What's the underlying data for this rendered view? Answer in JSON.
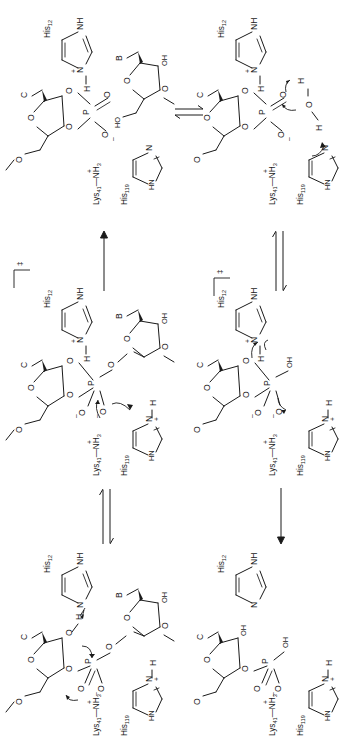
{
  "figure": {
    "orientation": "all labels rotated 90 degrees counter-clockwise",
    "background": "#ffffff",
    "ink": "#1a1a1a",
    "width": 353,
    "height": 745
  },
  "residues": {
    "his12": "His",
    "his12_sub": "12",
    "his119": "His",
    "his119_sub": "119",
    "lys41": "Lys",
    "lys41_sub": "41",
    "lys41_tail": "NH",
    "lys41_tail_sub": "3",
    "lys41_charge": "+"
  },
  "atoms": {
    "N": "N",
    "NH": "NH",
    "HN": "HN",
    "H": "H",
    "O": "O",
    "OH": "OH",
    "HO": "HO",
    "P": "P",
    "B": "B",
    "C": "C",
    "minus": "–",
    "plus": "+",
    "dagger": "‡"
  },
  "panels": [
    {
      "id": "p1",
      "name": "cyclic-phosphate-intermediate-with-leaving-nucleoside",
      "position": "top-left",
      "stage": "2',3'-cyclic phosphate intermediate + departed 5'-OH nucleoside",
      "his12_state": "protonated imidazolium (N-H, +)",
      "his119_state": "neutral imidazole",
      "lys41_state": "ammonium (NH3+)",
      "phosphorus_group": "cyclic 2',3'-phosphodiester, P=O and P-O(-)",
      "sugar_left_base": "C",
      "sugar_right_base": "B",
      "sugar_right_5prime": "HO",
      "sugar_right_2prime": "OH",
      "curly_arrows": 0
    },
    {
      "id": "p2",
      "name": "water-attack-on-cyclic-phosphate",
      "position": "top-right",
      "stage": "water activated by His119 attacks cyclic phosphate",
      "his12_state": "protonated imidazolium (N-H, +)",
      "his119_state": "neutral imidazole, general base",
      "lys41_state": "ammonium (NH3+)",
      "water": "H-O-H",
      "curly_arrows": 3
    },
    {
      "id": "p3",
      "name": "hydrolysis-transition-state",
      "position": "middle-right",
      "stage": "pentacoordinate transition state (hydrolysis)",
      "marker": "‡",
      "his12_state": "imidazolium donating proton",
      "his119_state": "protonated imidazolium (+)",
      "lys41_state": "ammonium (NH3+)",
      "phosphorus_group": "trigonal bipyramidal P with OH and two O(-)",
      "curly_arrows": 3
    },
    {
      "id": "p4",
      "name": "transphosphorylation-transition-state",
      "position": "middle-left",
      "stage": "pentacoordinate transition state (transphosphorylation)",
      "marker": "‡",
      "his12_state": "protonated imidazolium (N-H, +)",
      "his119_state": "protonated imidazolium (N-H, +)",
      "lys41_state": "ammonium (NH3+)",
      "sugar_right_base": "B",
      "sugar_right_2prime": "OH",
      "curly_arrows": 2
    },
    {
      "id": "p5",
      "name": "substrate-rna-dinucleotide",
      "position": "bottom-left",
      "stage": "intact RNA substrate; His12 abstracts 2'-OH proton",
      "his12_state": "neutral imidazole, general base",
      "his119_state": "protonated imidazolium (N-H, +)",
      "lys41_state": "ammonium (NH3+)",
      "sugar_right_base": "B",
      "sugar_right_2prime": "OH",
      "curly_arrows": 3
    },
    {
      "id": "p6",
      "name": "hydrolysis-product-3-phosphate",
      "position": "bottom-right",
      "stage": "3'-phosphate product released",
      "his12_state": "neutral imidazole",
      "his119_state": "protonated imidazolium (N-H, +)",
      "lys41_state": "ammonium (NH3+)",
      "phosphate": "P(=O)(OH)(O-)",
      "sugar_left_2prime": "OH",
      "curly_arrows": 0
    }
  ],
  "arrows": [
    {
      "id": "a1",
      "name": "equilibrium-arrow-top",
      "type": "equilibrium",
      "direction": "horizontal",
      "between": "p1 to p2"
    },
    {
      "id": "a2",
      "name": "equilibrium-arrow-right-upper",
      "type": "equilibrium",
      "direction": "vertical",
      "between": "p3 to p2"
    },
    {
      "id": "a3",
      "name": "reaction-arrow-left-upper",
      "type": "single",
      "direction": "vertical-up",
      "between": "p4 to p1"
    },
    {
      "id": "a4",
      "name": "equilibrium-arrow-left-lower",
      "type": "equilibrium",
      "direction": "vertical",
      "between": "p5 to p4"
    },
    {
      "id": "a5",
      "name": "reaction-arrow-right-lower",
      "type": "single",
      "direction": "vertical-down",
      "between": "p3 to p6"
    }
  ]
}
